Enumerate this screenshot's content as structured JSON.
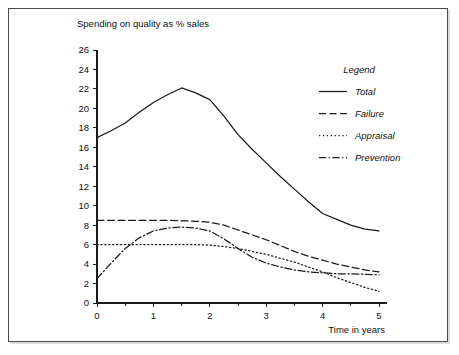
{
  "chart_data": {
    "type": "line",
    "title": "Spending on quality as % sales",
    "xlabel": "Time in years",
    "ylabel": "",
    "xlim": [
      0,
      5
    ],
    "ylim": [
      0,
      26
    ],
    "grid": false,
    "legend_position": "top-right",
    "legend_title": "Legend",
    "x_ticks": [
      "0",
      "1",
      "2",
      "3",
      "4",
      "5"
    ],
    "x_tick_values": [
      0,
      1,
      2,
      3,
      4,
      5
    ],
    "x_minor_tick_values": [
      0.5,
      1.5,
      2.5,
      3.5,
      4.5
    ],
    "y_ticks": [
      "0",
      "2",
      "4",
      "6",
      "8",
      "10",
      "12",
      "14",
      "16",
      "18",
      "20",
      "22",
      "24",
      "26"
    ],
    "y_tick_values": [
      0,
      2,
      4,
      6,
      8,
      10,
      12,
      14,
      16,
      18,
      20,
      22,
      24,
      26
    ],
    "x": [
      0,
      0.25,
      0.5,
      0.75,
      1,
      1.25,
      1.5,
      1.75,
      2,
      2.25,
      2.5,
      2.75,
      3,
      3.25,
      3.5,
      3.75,
      4,
      4.25,
      4.5,
      4.75,
      5
    ],
    "series": [
      {
        "name": "Total",
        "style": "solid",
        "values": [
          17.0,
          17.7,
          18.5,
          19.6,
          20.6,
          21.4,
          22.1,
          21.6,
          20.9,
          19.2,
          17.3,
          15.8,
          14.4,
          13.0,
          11.7,
          10.4,
          9.2,
          8.6,
          8.0,
          7.6,
          7.4
        ]
      },
      {
        "name": "Failure",
        "style": "dashed",
        "values": [
          8.5,
          8.5,
          8.5,
          8.5,
          8.5,
          8.5,
          8.45,
          8.4,
          8.3,
          8.0,
          7.5,
          7.0,
          6.5,
          5.9,
          5.3,
          4.8,
          4.4,
          4.0,
          3.7,
          3.4,
          3.2
        ]
      },
      {
        "name": "Appraisal",
        "style": "dotted",
        "values": [
          6.0,
          6.0,
          6.0,
          6.0,
          6.0,
          6.0,
          6.0,
          6.0,
          5.95,
          5.8,
          5.6,
          5.3,
          5.0,
          4.6,
          4.2,
          3.7,
          3.2,
          2.6,
          2.1,
          1.6,
          1.2
        ]
      },
      {
        "name": "Prevention",
        "style": "dashdot",
        "values": [
          2.5,
          4.1,
          5.6,
          6.7,
          7.4,
          7.7,
          7.8,
          7.7,
          7.4,
          6.6,
          5.6,
          4.7,
          4.1,
          3.7,
          3.4,
          3.2,
          3.1,
          3.0,
          3.0,
          2.95,
          2.9
        ]
      }
    ]
  },
  "colors": {
    "ink": "#1a1a1a",
    "frame": "#4a4a4a",
    "background": "#ffffff"
  }
}
